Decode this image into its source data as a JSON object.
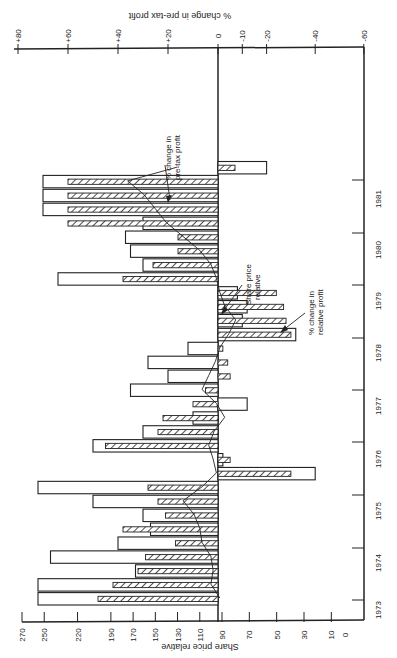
{
  "chart_data": {
    "type": "bar",
    "orientation": "rotated-90-clockwise",
    "title": "",
    "top_axis": {
      "label": "% change in pre-tax profit",
      "ticks": [
        "+80",
        "+60",
        "+40",
        "+20",
        "0",
        "-10",
        "-20",
        "-40",
        "-60"
      ],
      "tick_values": [
        80,
        60,
        40,
        20,
        0,
        -10,
        -20,
        -40,
        -60
      ],
      "range": [
        80,
        -60
      ]
    },
    "bottom_axis": {
      "label": "Share price relative",
      "ticks": [
        "270",
        "250",
        "220",
        "190",
        "170",
        "150",
        "130",
        "110",
        "90",
        "70",
        "50",
        "30",
        "10",
        "0"
      ],
      "tick_values": [
        270,
        250,
        220,
        190,
        170,
        150,
        130,
        110,
        90,
        70,
        50,
        30,
        10,
        0
      ]
    },
    "time_axis": {
      "ticks": [
        "1973",
        "1974",
        "1975",
        "1976",
        "1977",
        "1978",
        "1979",
        "1980",
        "1981"
      ]
    },
    "annotations": [
      {
        "text_line1": "% change in",
        "text_line2": "pre-tax profit",
        "target": "open bars"
      },
      {
        "text_line1": "Share price",
        "text_line2": "relative",
        "target": "line"
      },
      {
        "text_line1": "% change in",
        "text_line2": "relative profit",
        "target": "hatched bars"
      }
    ],
    "legend": "none (annotations with arrows)",
    "grid": false,
    "series": [
      {
        "name": "% change in pre-tax profit",
        "style": "open bar",
        "periods": [
          "1973Q1",
          "1973Q2",
          "1973Q3",
          "1974Q1",
          "1974Q2",
          "1974Q3",
          "1974Q4",
          "1975Q1",
          "1975Q2",
          "1975Q3",
          "1975Q4",
          "1976Q1",
          "1976Q2",
          "1976Q3",
          "1976Q4",
          "1977Q1",
          "1977Q2",
          "1977Q3",
          "1978Q1",
          "1978Q2",
          "1978Q3",
          "1978Q4",
          "1979Q1",
          "1979Q2",
          "1979Q3",
          "1979Q4",
          "1980Q1",
          "1980Q2",
          "1980Q3",
          "1980Q4",
          "1981Q1",
          "1981Q2"
        ],
        "values": [
          72,
          72,
          33,
          67,
          40,
          27,
          30,
          50,
          72,
          -40,
          -2,
          50,
          30,
          10,
          -12,
          35,
          20,
          28,
          12,
          -32,
          -10,
          -12,
          -8,
          64,
          30,
          35,
          37,
          30,
          70,
          70,
          70,
          -20
        ]
      },
      {
        "name": "% change in relative profit",
        "style": "hatched bar",
        "values": [
          48,
          42,
          32,
          29,
          17,
          38,
          21,
          24,
          28,
          -30,
          -5,
          45,
          24,
          22,
          10,
          5,
          -5,
          -4,
          -2,
          -30,
          -28,
          -27,
          -24,
          38,
          26,
          16,
          16,
          60,
          60,
          60,
          60,
          -7
        ]
      },
      {
        "name": "Share price relative",
        "style": "line",
        "values": [
          92,
          100,
          98,
          100,
          108,
          110,
          115,
          125,
          108,
          95,
          98,
          102,
          97,
          88,
          95,
          108,
          102,
          96,
          92,
          85,
          80,
          88,
          92,
          95,
          100,
          110,
          125,
          140,
          150,
          160,
          175,
          130
        ]
      }
    ]
  }
}
